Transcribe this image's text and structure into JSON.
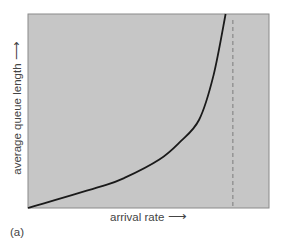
{
  "figure": {
    "panel_label": "(a)",
    "ylabel": "average queue length",
    "ylabel_arrow": "⟶",
    "xlabel": "arrival rate",
    "xlabel_arrow": "⟶"
  },
  "colors": {
    "plot_bg": "#c6c6c6",
    "plot_border": "#8a8a8a",
    "curve": "#1a1a1a",
    "asymptote": "#888888",
    "text": "#444444"
  },
  "chart_data": {
    "type": "line",
    "title": "",
    "xlabel": "arrival rate",
    "ylabel": "average queue length",
    "panel": "(a)",
    "grid": false,
    "axes_ticks": false,
    "series": [
      {
        "name": "average queue length",
        "style": "solid",
        "x": [
          0,
          0.3,
          0.4,
          0.545,
          0.63,
          0.71,
          0.77,
          0.82
        ],
        "y": [
          0,
          0.11,
          0.155,
          0.25,
          0.34,
          0.455,
          0.685,
          1.0
        ]
      }
    ],
    "annotations": [
      {
        "type": "vertical_dashed_line",
        "x": 0.85,
        "meaning": "capacity asymptote"
      }
    ],
    "xlim": [
      0,
      1
    ],
    "ylim": [
      0,
      1
    ]
  }
}
